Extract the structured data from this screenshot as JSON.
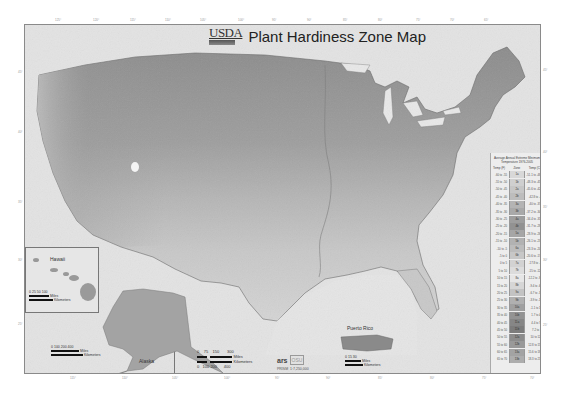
{
  "map": {
    "agency": "USDA",
    "title": "Plant Hardiness Zone Map",
    "insets": {
      "hawaii": {
        "label": "Hawaii",
        "scale_ticks": [
          "0",
          "25",
          "50",
          "100"
        ],
        "scale_units": [
          "Miles",
          "Kilometers"
        ]
      },
      "alaska": {
        "label": "Alaska",
        "scale_ticks": [
          "0",
          "100",
          "200",
          "400"
        ],
        "scale_units": [
          "Miles",
          "Kilometers"
        ]
      },
      "puerto_rico": {
        "label": "Puerto Rico",
        "scale_ticks": [
          "0",
          "15",
          "30"
        ],
        "scale_units": [
          "Miles",
          "Kilometers"
        ]
      }
    },
    "main_scale": {
      "miles_ticks": [
        "0",
        "75",
        "150",
        "300"
      ],
      "km_ticks": [
        "0",
        "100",
        "200",
        "400"
      ],
      "miles_label": "Miles",
      "km_label": "Kilometers"
    },
    "footer": {
      "logo1": "ars",
      "logo2": "OSU",
      "credit": "PRISM",
      "scale_note": "1:7,250,000"
    }
  },
  "legend": {
    "header": "Average Annual Extreme Minimum Temperature 1976-2005",
    "col_f": "Temp (F)",
    "col_zone": "Zone",
    "col_c": "Temp (C)",
    "rows": [
      {
        "f": "-60 to -55",
        "zone": "1a",
        "c": "-51.1 to -48.3",
        "shade": "#d8d8d8"
      },
      {
        "f": "-55 to -50",
        "zone": "1b",
        "c": "-48.3 to -45.6",
        "shade": "#cfcfcf"
      },
      {
        "f": "-50 to -45",
        "zone": "2a",
        "c": "-45.6 to -42.8",
        "shade": "#c6c6c6"
      },
      {
        "f": "-45 to -40",
        "zone": "2b",
        "c": "-42.8 to -40",
        "shade": "#bdbdbd"
      },
      {
        "f": "-40 to -35",
        "zone": "3a",
        "c": "-40 to -37.2",
        "shade": "#b4b4b4"
      },
      {
        "f": "-35 to -30",
        "zone": "3b",
        "c": "-37.2 to -34.4",
        "shade": "#a9a9a9"
      },
      {
        "f": "-30 to -25",
        "zone": "4a",
        "c": "-34.4 to -31.7",
        "shade": "#9e9e9e"
      },
      {
        "f": "-25 to -20",
        "zone": "4b",
        "c": "-31.7 to -28.9",
        "shade": "#929292"
      },
      {
        "f": "-20 to -15",
        "zone": "5a",
        "c": "-28.9 to -26.1",
        "shade": "#a6a6a6"
      },
      {
        "f": "-15 to -10",
        "zone": "5b",
        "c": "-26.1 to -23.3",
        "shade": "#b2b2b2"
      },
      {
        "f": "-10 to -5",
        "zone": "6a",
        "c": "-23.3 to -20.6",
        "shade": "#bcbcbc"
      },
      {
        "f": "-5 to 0",
        "zone": "6b",
        "c": "-20.6 to -17.8",
        "shade": "#c7c7c7"
      },
      {
        "f": "0 to 5",
        "zone": "7a",
        "c": "-17.8 to -15",
        "shade": "#d2d2d2"
      },
      {
        "f": "5 to 10",
        "zone": "7b",
        "c": "-15 to -12.2",
        "shade": "#dcdcdc"
      },
      {
        "f": "10 to 15",
        "zone": "8a",
        "c": "-12.2 to -9.4",
        "shade": "#e6e6e6"
      },
      {
        "f": "15 to 20",
        "zone": "8b",
        "c": "-9.4 to -6.7",
        "shade": "#d6d6d6"
      },
      {
        "f": "20 to 25",
        "zone": "9a",
        "c": "-6.7 to -3.9",
        "shade": "#c3c3c3"
      },
      {
        "f": "25 to 30",
        "zone": "9b",
        "c": "-3.9 to -1.1",
        "shade": "#b0b0b0"
      },
      {
        "f": "30 to 35",
        "zone": "10a",
        "c": "-1.1 to 1.7",
        "shade": "#a0a0a0"
      },
      {
        "f": "35 to 40",
        "zone": "10b",
        "c": "1.7 to 4.4",
        "shade": "#939393"
      },
      {
        "f": "40 to 45",
        "zone": "11a",
        "c": "4.4 to 7.2",
        "shade": "#868686"
      },
      {
        "f": "45 to 50",
        "zone": "11b",
        "c": "7.2 to 10",
        "shade": "#7c7c7c"
      },
      {
        "f": "50 to 55",
        "zone": "12a",
        "c": "10 to 12.8",
        "shade": "#8c8c8c"
      },
      {
        "f": "55 to 60",
        "zone": "12b",
        "c": "12.8 to 15.6",
        "shade": "#999999"
      },
      {
        "f": "60 to 65",
        "zone": "13a",
        "c": "15.6 to 18.3",
        "shade": "#a3a3a3"
      },
      {
        "f": "65 to 70",
        "zone": "13b",
        "c": "18.3 to 21.1",
        "shade": "#adadad"
      }
    ]
  },
  "graticule": {
    "top_ticks": [
      "125°",
      "120°",
      "115°",
      "110°",
      "105°",
      "100°",
      "95°",
      "90°",
      "85°",
      "80°",
      "75°",
      "70°",
      "65°"
    ],
    "bottom_ticks": [
      "115°",
      "110°",
      "105°",
      "100°",
      "95°",
      "90°",
      "85°",
      "80°",
      "75°",
      "70°"
    ],
    "left_ticks": [
      "45°",
      "40°",
      "35°",
      "30°",
      "25°"
    ],
    "right_ticks": [
      "45°",
      "40°",
      "35°",
      "30°",
      "25°"
    ]
  },
  "colors": {
    "frame": "#e3e3e3",
    "land_dark": "#8f8f8f",
    "land_mid": "#a8a8a8",
    "land_light": "#c9c9c9",
    "water": "#e6e6e6"
  }
}
